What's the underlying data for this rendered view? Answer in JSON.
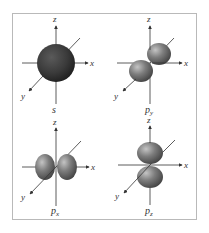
{
  "figure": {
    "title": "",
    "panels": [
      {
        "id": "s",
        "label_main": "s",
        "label_sub": "",
        "shape": "sphere",
        "center": [
          56,
          63
        ],
        "axes": {
          "x": "x",
          "y": "y",
          "z": "z"
        }
      },
      {
        "id": "py",
        "label_main": "p",
        "label_sub": "y",
        "shape": "dumbbell-along-y",
        "center": [
          150,
          63
        ],
        "axes": {
          "x": "x",
          "y": "y",
          "z": "z"
        }
      },
      {
        "id": "px",
        "label_main": "p",
        "label_sub": "x",
        "shape": "dumbbell-along-x",
        "center": [
          56,
          167
        ],
        "axes": {
          "x": "x",
          "y": "y",
          "z": "z"
        }
      },
      {
        "id": "pz",
        "label_main": "p",
        "label_sub": "z",
        "shape": "dumbbell-along-z",
        "center": [
          150,
          167
        ],
        "axes": {
          "x": "x",
          "y": "y",
          "z": "z"
        }
      }
    ],
    "colors": {
      "frame_border": "#b9b9b9",
      "axis_line": "#333333",
      "sphere_fill": "#3a3a3a",
      "lobe_light": "#b8b8b8",
      "lobe_mid": "#7a7a7a",
      "lobe_dark": "#474747",
      "label": "#333333"
    }
  }
}
